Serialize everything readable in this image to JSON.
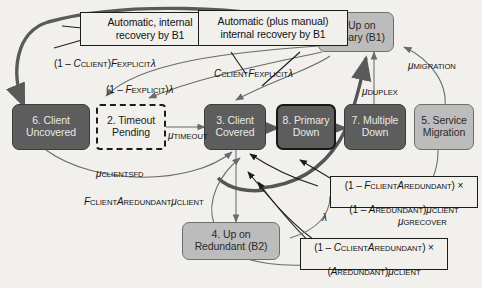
{
  "diagram": {
    "background_color": "#f1f0ec",
    "colors": {
      "dark_state_fill": "#5d5d5d",
      "light_state_fill": "#bcbcbc",
      "dark_state_text": "#e9e9e9",
      "light_state_text": "#2a2a2a",
      "edge_stroke": "#6a6a6a",
      "thick_edge_stroke": "#555555",
      "outline": "#1c1c1c"
    }
  },
  "states": [
    {
      "id": "s6",
      "label": "6. Client\nUncovered",
      "style": "dark",
      "number": "6"
    },
    {
      "id": "s2",
      "label": "2. Timeout\nPending",
      "style": "dashed",
      "number": "2"
    },
    {
      "id": "s3",
      "label": "3. Client\nCovered",
      "style": "dark",
      "number": "3"
    },
    {
      "id": "s8",
      "label": "8. Primary\nDown",
      "style": "dark-thick",
      "number": "8"
    },
    {
      "id": "s7",
      "label": "7. Multiple\nDown",
      "style": "dark",
      "number": "7"
    },
    {
      "id": "s5",
      "label": "5. Service\nMigration",
      "style": "light",
      "number": "5"
    },
    {
      "id": "s1",
      "label": "1. Up on\nPrimary (B1)",
      "style": "light",
      "number": "1"
    },
    {
      "id": "s4",
      "label": "4. Up on\nRedundant (B2)",
      "style": "light",
      "number": "4"
    }
  ],
  "callouts": [
    {
      "id": "c_auto_internal",
      "text": "Automatic, internal\nrecovery by B1"
    },
    {
      "id": "c_auto_plus_manual",
      "text": "Automatic (plus manual)\ninternal recovery by B1"
    }
  ],
  "formula_boxes": [
    {
      "id": "f_fclient_aredundant",
      "line1_prefix": "(1 – ",
      "line1": "(1 – FCLIENTAREDUNDANT) ×",
      "line2": "(1 – AREDUNDANT)μCLIENT"
    },
    {
      "id": "f_cclient_aredundant",
      "line1": "(1 – CCLIENTAREDUNDANT) ×",
      "line2": "(AREDUNDANT)μCLIENT"
    }
  ],
  "edge_labels": [
    {
      "id": "l_1mc_fexplicit",
      "text": "(1 – CCLIENT)FEXPLICITλ"
    },
    {
      "id": "l_1mf_explicit",
      "text": "(1 – FEXPLICIT)λ"
    },
    {
      "id": "l_c_fexplicit",
      "text": "CCLIENTFEXPLICITλ"
    },
    {
      "id": "l_mu_timeout",
      "text": "μTIMEOUT"
    },
    {
      "id": "l_mu_clientsfd",
      "text": "μCLIENTSFD"
    },
    {
      "id": "l_f_a_mu_client",
      "text": "FCLIENTAREDUNDANTμCLIENT"
    },
    {
      "id": "l_mu_duplex",
      "text": "μDUPLEX"
    },
    {
      "id": "l_mu_migration",
      "text": "μMIGRATION"
    },
    {
      "id": "l_mu_grecover",
      "text": "μGRECOVER"
    },
    {
      "id": "l_lambda",
      "text": "λ"
    }
  ]
}
